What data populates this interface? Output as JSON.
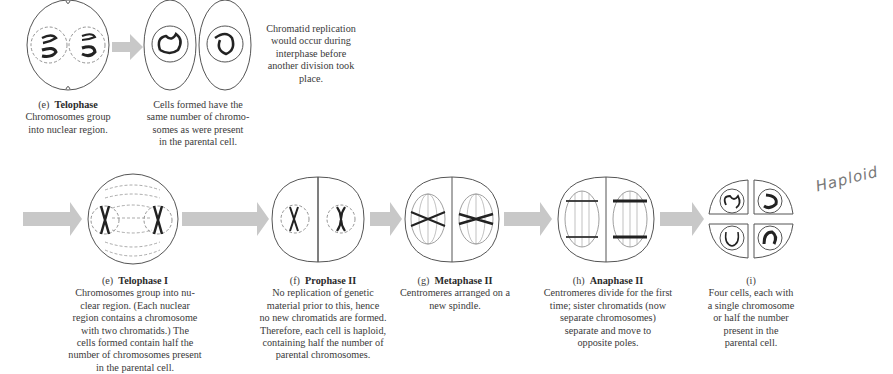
{
  "figure": {
    "top_row": {
      "stage_e": {
        "letter": "(e)",
        "name": "Telophase",
        "description_lines": [
          "Chromosomes group",
          "into nuclear region."
        ]
      },
      "result_cells": {
        "description_lines": [
          "Cells formed have the",
          "same number of chromo-",
          "somes as were present",
          "in the parental cell."
        ]
      },
      "note": {
        "lines": [
          "Chromatid replication",
          "would occur during",
          "interphase before",
          "another division took",
          "place."
        ]
      }
    },
    "bottom_row": {
      "stages": [
        {
          "letter": "(e)",
          "name": "Telophase I",
          "description_lines": [
            "Chromosomes group into nu-",
            "clear region. (Each nuclear",
            "region contains a chromosome",
            "with two chromatids.) The",
            "cells formed contain half the",
            "number of chromosomes present",
            "in the parental cell."
          ]
        },
        {
          "letter": "(f)",
          "name": "Prophase II",
          "description_lines": [
            "No replication of genetic",
            "material prior to this, hence",
            "no new chromatids are formed.",
            "Therefore, each cell is haploid,",
            "containing half the number of",
            "parental chromosomes."
          ]
        },
        {
          "letter": "(g)",
          "name": "Metaphase II",
          "description_lines": [
            "Centromeres arranged on a",
            "new spindle."
          ]
        },
        {
          "letter": "(h)",
          "name": "Anaphase II",
          "description_lines": [
            "Centromeres divide for the first",
            "time; sister chromatids (now",
            "separate chromosomes)",
            "separate and move to",
            "opposite poles."
          ]
        },
        {
          "letter": "(i)",
          "name": "",
          "description_lines": [
            "Four cells, each with",
            "a single chromosome",
            "or half the number",
            "present in the",
            "parental cell."
          ]
        }
      ]
    },
    "handwritten_annotation": "Haploid",
    "colors": {
      "arrow": "#c8c8c8",
      "outline": "#555555",
      "chromosome": "#222222",
      "spindle": "#888888"
    }
  }
}
